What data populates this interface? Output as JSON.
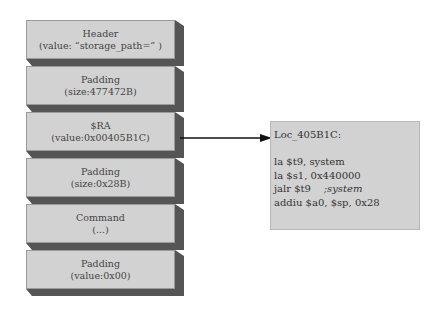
{
  "stack": {
    "blocks": [
      {
        "title": "Header",
        "value": "(value: “storage_path=” )"
      },
      {
        "title": "Padding",
        "value": "(size:477472B)"
      },
      {
        "title": "$RA",
        "value": "(value:0x00405B1C)"
      },
      {
        "title": "Padding",
        "value": "(size:0x28B)"
      },
      {
        "title": "Command",
        "value": "(...)"
      },
      {
        "title": "Padding",
        "value": "(value:0x00)"
      }
    ]
  },
  "code": {
    "label": "Loc_405B1C:",
    "lines": [
      {
        "text": "la $t9, system",
        "comment": ""
      },
      {
        "text": "la $s1, 0x440000",
        "comment": ""
      },
      {
        "text": "jalr $t9    ",
        "comment": ";system"
      },
      {
        "text": "addiu $a0, $sp, 0x28",
        "comment": ""
      }
    ]
  },
  "colors": {
    "block_face": "#d2d2d2",
    "block_shadow": "#555555",
    "arrow": "#111111"
  }
}
